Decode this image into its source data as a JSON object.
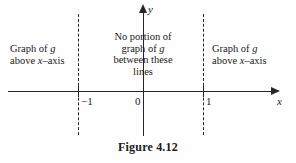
{
  "figure": {
    "caption": "Figure 4.12",
    "background_color": "#fefefe",
    "ink_color": "#262626"
  },
  "axes": {
    "x_label": "x",
    "y_label": "y",
    "tick_labels": [
      {
        "name": "neg-one",
        "text": "−1"
      },
      {
        "name": "zero",
        "text": "0"
      },
      {
        "name": "one",
        "text": "1"
      }
    ]
  },
  "annotations": {
    "left": {
      "line1_pre": "Graph of ",
      "line1_italic": "g",
      "line2_pre": "above ",
      "line2_italic": "x",
      "line2_post": "–axis"
    },
    "center": {
      "line1": "No portion of",
      "line2_pre": "graph of ",
      "line2_italic": "g",
      "line3": "between these",
      "line4": "lines"
    },
    "right": {
      "line1_pre": "Graph of ",
      "line1_italic": "g",
      "line2_pre": "above ",
      "line2_italic": "x",
      "line2_post": "–axis"
    }
  },
  "dashed_lines": {
    "left_at": "−1",
    "right_at": "1"
  }
}
